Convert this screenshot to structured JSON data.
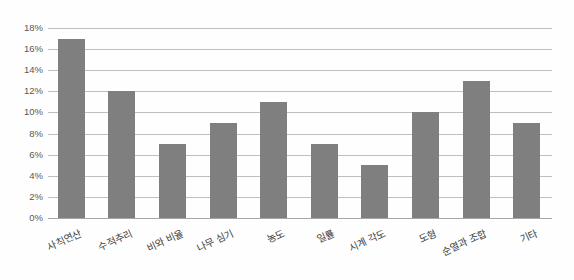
{
  "chart_data": {
    "type": "bar",
    "title": "",
    "xlabel": "",
    "ylabel": "",
    "categories": [
      "사칙연산",
      "수적추리",
      "비와 비율",
      "나무 심기",
      "농도",
      "일률",
      "시계 각도",
      "도형",
      "순열과 조합",
      "기타"
    ],
    "values": [
      17,
      12,
      7,
      9,
      11,
      7,
      5,
      10,
      13,
      9
    ],
    "value_unit": "%",
    "ylim": [
      0,
      18
    ],
    "ytick_step": 2,
    "ytick_labels": [
      "0%",
      "2%",
      "4%",
      "6%",
      "8%",
      "10%",
      "12%",
      "14%",
      "16%",
      "18%"
    ],
    "grid": "horizontal",
    "legend": "none",
    "colors": {
      "bar": "#7f7f7f",
      "gridline": "#bfbfbf",
      "axis_line": "#a6a6a6",
      "y_tick_text": "#595959",
      "x_tick_text": "#404040",
      "background": "#fefefe"
    }
  }
}
